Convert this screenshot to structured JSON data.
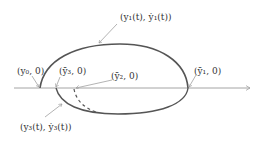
{
  "diagram": {
    "colors": {
      "curve": "#555555",
      "axis": "#9a9a9a",
      "leader": "#a0a0a0",
      "text": "#333333"
    },
    "labels": {
      "top_point": "(y₁(t), ẏ₁(t))",
      "start_point": "(y₀, 0)",
      "ybar3": "(ȳ₃, 0)",
      "ybar2": "(ȳ₂, 0)",
      "ybar1": "(ȳ₁, 0)",
      "bottom_point": "(y₃(t), ẏ₃(t))"
    },
    "axis": {
      "direction": "right",
      "arrow": true
    }
  }
}
